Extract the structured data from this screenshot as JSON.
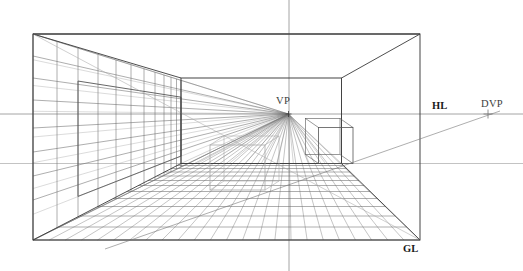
{
  "canvas": {
    "width": 523,
    "height": 271,
    "background": "#ffffff",
    "title": "One-Point Perspective Room Construction"
  },
  "palette": {
    "frame_stroke": "#3a3a3a",
    "wall_stroke": "#555555",
    "grid_stroke": "#6b6b6b",
    "light_guide": "#a9a9a9",
    "very_light_guide": "#bcbcbc",
    "ray_stroke": "#777777",
    "label_color": "#1a1a1a",
    "label_color_soft": "#3d3d3d",
    "axis_stroke": "#9a9a9a"
  },
  "labels": [
    {
      "id": "vp",
      "text": "VP",
      "x": 276,
      "y": 104,
      "weight": "plain",
      "name": "vanishing-point-label"
    },
    {
      "id": "hl",
      "text": "HL",
      "x": 432,
      "y": 109,
      "weight": "bold",
      "name": "horizon-line-label"
    },
    {
      "id": "dvp",
      "text": "DVP",
      "x": 481,
      "y": 107,
      "weight": "plain",
      "name": "distance-vanishing-point-label"
    },
    {
      "id": "gl",
      "text": "GL",
      "x": 403,
      "y": 252,
      "weight": "bold",
      "name": "ground-line-label"
    }
  ],
  "geometry": {
    "vanishing_point": {
      "x": 288.5,
      "y": 114.0
    },
    "distance_vanishing_point": {
      "x": 488.0,
      "y": 114.0
    },
    "horizon_line_y": 114.0,
    "second_reference_line_y": 163.5,
    "vertical_axis_x": 289.0,
    "picture_frame": {
      "left": 33.0,
      "top": 34.0,
      "right": 420.0,
      "bottom": 240.0
    },
    "back_wall": {
      "left": 181.0,
      "top": 78.0,
      "right": 341.5,
      "bottom": 163.5
    },
    "left_panel": {
      "left": 78.0,
      "top": 74.0,
      "right": 181.0,
      "bottom": 214.0
    },
    "right_box": {
      "front_left": 318.5,
      "front_right": 353.0,
      "front_top": 127.5,
      "front_bottom": 163.5,
      "depth_dx": -13.0,
      "depth_dy": -9.0
    },
    "left_box": {
      "front_left": 210.0,
      "front_right": 265.0,
      "front_top": 145.0,
      "front_bottom": 190.0,
      "depth_dx": 14.0,
      "depth_dy": -9.0
    },
    "floor_transversals_y": [
      165.5,
      168.5,
      172.0,
      176.0,
      180.5,
      185.5,
      191.5,
      198.5,
      206.5,
      216.0,
      227.0,
      240.0
    ],
    "floor_ray_count": 24,
    "left_wall_horizontals_y": [
      34.0,
      56.0,
      78.0,
      100.0,
      128.0,
      152.0,
      176.0,
      200.0,
      240.0
    ],
    "left_wall_vertical_xs": [
      33.0,
      57.0,
      78.0,
      98.0,
      116.0,
      131.0,
      144.0,
      155.0,
      164.0,
      171.0,
      176.5,
      181.0
    ],
    "ceiling_diag_from": {
      "x": 33.0,
      "y": 34.0
    },
    "ceiling_diag_to": {
      "x": 420.0,
      "y": 34.0
    },
    "dvp_diagonal": {
      "x1": 105.0,
      "y1": 249.0,
      "x2": 500.0,
      "y2": 111.0
    },
    "dvp_tick": {
      "x": 488.0,
      "y": 114.0,
      "size": 4.5
    }
  },
  "legend": {
    "vp_meaning": "Vanishing Point",
    "hl_meaning": "Horizon Line",
    "dvp_meaning": "Distance Vanishing Point",
    "gl_meaning": "Ground Line"
  }
}
